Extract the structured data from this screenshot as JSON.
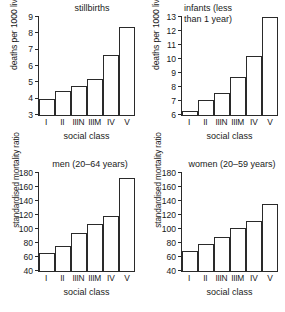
{
  "figure": {
    "panel_count": 4,
    "shared_xlabel": "social class",
    "shared_categories": [
      "I",
      "II",
      "IIIN",
      "IIIM",
      "IV",
      "V"
    ]
  },
  "chart_data": [
    {
      "id": "stillbirths",
      "type": "bar",
      "title": "stillbirths",
      "xlabel": "social class",
      "ylabel": "deaths per 1000 live births",
      "categories": [
        "I",
        "II",
        "IIIN",
        "IIIM",
        "IV",
        "V"
      ],
      "values": [
        4.0,
        4.5,
        4.8,
        5.2,
        6.7,
        8.4
      ],
      "ylim": [
        3,
        9
      ],
      "yticks": [
        3,
        4,
        5,
        6,
        7,
        8,
        9
      ],
      "grid": false,
      "legend": "none"
    },
    {
      "id": "infants",
      "type": "bar",
      "title": "infants (less than 1 year)",
      "title_lines": [
        "infants (less",
        "than 1 year)"
      ],
      "xlabel": "social class",
      "ylabel": "deaths per 1000 live births",
      "categories": [
        "I",
        "II",
        "IIIN",
        "IIIM",
        "IV",
        "V"
      ],
      "values": [
        6.3,
        7.05,
        7.55,
        8.75,
        10.2,
        13.0
      ],
      "ylim": [
        6,
        13
      ],
      "yticks": [
        6,
        7,
        8,
        9,
        10,
        11,
        12,
        13
      ],
      "grid": false,
      "legend": "none"
    },
    {
      "id": "men",
      "type": "bar",
      "title": "men (20–64 years)",
      "xlabel": "social class",
      "ylabel": "standardised mortality ratio",
      "categories": [
        "I",
        "II",
        "IIIN",
        "IIIM",
        "IV",
        "V"
      ],
      "values": [
        66,
        76,
        95,
        107,
        118,
        173
      ],
      "ylim": [
        40,
        180
      ],
      "yticks": [
        40,
        60,
        80,
        100,
        120,
        140,
        160,
        180
      ],
      "grid": false,
      "legend": "none"
    },
    {
      "id": "women",
      "type": "bar",
      "title": "women (20–59 years)",
      "xlabel": "social class",
      "ylabel": "standardised mortality ratio",
      "categories": [
        "I",
        "II",
        "IIIN",
        "IIIM",
        "IV",
        "V"
      ],
      "values": [
        69,
        78,
        88,
        101,
        111,
        136
      ],
      "ylim": [
        40,
        180
      ],
      "yticks": [
        40,
        60,
        80,
        100,
        120,
        140,
        160,
        180
      ],
      "grid": false,
      "legend": "none"
    }
  ],
  "colors": {
    "ink": "#2a2a2a",
    "background": "#ffffff",
    "bar_fill": "#ffffff"
  }
}
